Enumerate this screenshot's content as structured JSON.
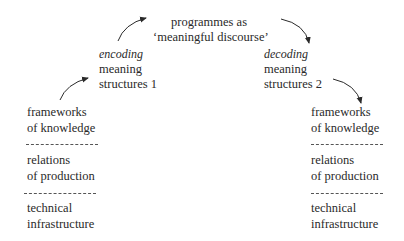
{
  "diagram": {
    "top": {
      "line1": "programmes as",
      "line2": "‘meaningful discourse’"
    },
    "encoding": {
      "label": "encoding",
      "line1": "meaning",
      "line2": "structures 1"
    },
    "decoding": {
      "label": "decoding",
      "line1": "meaning",
      "line2": "structures 2"
    },
    "left_stack": {
      "frameworks": {
        "line1": "frameworks",
        "line2": "of knowledge"
      },
      "relations": {
        "line1": "relations",
        "line2": "of production"
      },
      "technical": {
        "line1": "technical",
        "line2": "infrastructure"
      }
    },
    "right_stack": {
      "frameworks": {
        "line1": "frameworks",
        "line2": "of knowledge"
      },
      "relations": {
        "line1": "relations",
        "line2": "of production"
      },
      "technical": {
        "line1": "technical",
        "line2": "infrastructure"
      }
    },
    "arrows": [
      "frameworks-to-encoding",
      "encoding-to-programmes",
      "programmes-to-decoding",
      "decoding-to-frameworks"
    ],
    "ink_color": "#2a2a2a"
  }
}
